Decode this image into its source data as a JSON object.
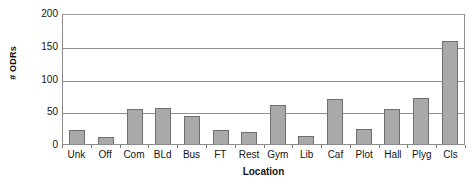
{
  "chart_data": {
    "type": "bar",
    "title": "",
    "xlabel": "Location",
    "ylabel": "# ODRs",
    "categories": [
      "Unk",
      "Off",
      "Com",
      "BLd",
      "Bus",
      "FT",
      "Rest",
      "Gym",
      "Lib",
      "Caf",
      "Plot",
      "Hall",
      "Plyg",
      "Cls"
    ],
    "values": [
      21,
      10,
      53,
      55,
      43,
      21,
      18,
      59,
      13,
      68,
      23,
      53,
      70,
      158
    ],
    "ylim": [
      0,
      200
    ],
    "yticks": [
      0,
      50,
      100,
      150,
      200
    ],
    "ytick_labels": [
      "0",
      "50",
      "100",
      "150",
      "200"
    ],
    "grid": "horizontal",
    "legend": "none",
    "series_color": "#a9a9a9",
    "series_edge_color": "#6f6f6f",
    "axis_color": "#8c8c8c",
    "text_color": "#141414"
  }
}
